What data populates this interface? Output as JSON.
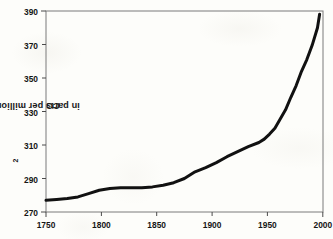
{
  "chart_data": {
    "type": "line",
    "title": "",
    "subtitle": "",
    "xlabel": "",
    "ylabel": "CO2 in parts per million (ppm)",
    "ylabel_parts": {
      "prefix": "CO",
      "sub": "2",
      "suffix": " in parts per million (ppm)"
    },
    "xlim": [
      1750,
      2010
    ],
    "ylim": [
      270,
      390
    ],
    "xticks": [
      1750,
      1800,
      1850,
      1900,
      1950,
      2000
    ],
    "yticks": [
      270,
      290,
      310,
      330,
      350,
      370,
      390
    ],
    "grid": false,
    "legend": null,
    "legend_position": "none",
    "series": [
      {
        "name": "Atmospheric CO2 concentration",
        "color": "#111111",
        "line_width": 3,
        "x": [
          1750,
          1760,
          1770,
          1780,
          1790,
          1800,
          1810,
          1820,
          1830,
          1840,
          1850,
          1860,
          1870,
          1880,
          1890,
          1900,
          1910,
          1920,
          1930,
          1940,
          1950,
          1955,
          1960,
          1965,
          1970,
          1975,
          1980,
          1985,
          1990,
          1995,
          2000,
          2005,
          2007
        ],
        "y": [
          277,
          277.5,
          278,
          279,
          281,
          283,
          284,
          284.5,
          284.5,
          284.5,
          285,
          286,
          287.5,
          290,
          294,
          296.5,
          299.5,
          303,
          306,
          309,
          311.5,
          313.5,
          316.5,
          320,
          325.5,
          331,
          338.5,
          345.5,
          354,
          361,
          369.5,
          380,
          388
        ]
      }
    ],
    "annotations": []
  },
  "axes": {
    "x_tick_labels": [
      "1750",
      "1800",
      "1850",
      "1900",
      "1950",
      "2000"
    ],
    "y_tick_labels": [
      "270",
      "290",
      "310",
      "330",
      "350",
      "370",
      "390"
    ]
  },
  "style": {
    "background": "#fdfdfa",
    "axis_color": "#6b6b6b",
    "line_color": "#111111",
    "text_color": "#151515"
  }
}
